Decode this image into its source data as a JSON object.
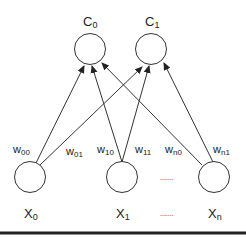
{
  "diagram": {
    "outputs": [
      {
        "id": "c0",
        "label": "C",
        "sub": "0",
        "cx": 90,
        "cy": 49
      },
      {
        "id": "c1",
        "label": "C",
        "sub": "1",
        "cx": 151,
        "cy": 49
      }
    ],
    "inputs": [
      {
        "id": "x0",
        "label": "X",
        "sub": "0",
        "cx": 30,
        "cy": 177
      },
      {
        "id": "x1",
        "label": "X",
        "sub": "1",
        "cx": 122,
        "cy": 177
      },
      {
        "id": "xn",
        "label": "X",
        "sub": "n",
        "cx": 214,
        "cy": 177
      }
    ],
    "ellipsis": ".......",
    "weights": [
      {
        "label": "w",
        "sub": "00"
      },
      {
        "label": "w",
        "sub": "01"
      },
      {
        "label": "w",
        "sub": "10"
      },
      {
        "label": "w",
        "sub": "11"
      },
      {
        "label": "w",
        "sub": "n0"
      },
      {
        "label": "w",
        "sub": "n1"
      }
    ]
  }
}
